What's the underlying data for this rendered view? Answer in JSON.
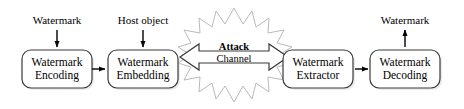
{
  "diagram": {
    "colors": {
      "stroke": "#3a3a3a",
      "burst_stroke": "#b9b9b9",
      "arrow": "#000000",
      "text": "#000000",
      "background": "#ffffff"
    },
    "blocks": [
      {
        "id": "encoding",
        "line1": "Watermark",
        "line2": "Encoding"
      },
      {
        "id": "embedding",
        "line1": "Watermark",
        "line2": "Embedding"
      },
      {
        "id": "extractor",
        "line1": "Watermark",
        "line2": "Extractor"
      },
      {
        "id": "decoding",
        "line1": "Watermark",
        "line2": "Decoding"
      }
    ],
    "io_labels": [
      {
        "id": "input-watermark",
        "text": "Watermark"
      },
      {
        "id": "host-object",
        "text": "Host object"
      },
      {
        "id": "output-watermark",
        "text": "Watermark"
      }
    ],
    "attack": {
      "line1": "Attack",
      "line2": "Channel"
    }
  }
}
